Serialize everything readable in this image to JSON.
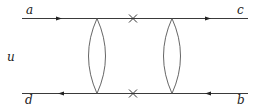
{
  "diagram": {
    "type": "feynman-diagram",
    "labels": {
      "top_left": "a",
      "top_right": "c",
      "bottom_left": "d",
      "bottom_right": "b",
      "left_middle": "u"
    },
    "lines": [
      {
        "name": "top-line",
        "from": "a",
        "to": "c",
        "direction": "right",
        "arrows": 2,
        "crosses": 1
      },
      {
        "name": "bottom-line",
        "from": "b",
        "to": "d",
        "direction": "left",
        "arrows": 2,
        "crosses": 1
      }
    ],
    "loops": [
      {
        "name": "left-lens",
        "shape": "lens"
      },
      {
        "name": "right-lens",
        "shape": "lens"
      }
    ],
    "colors": {
      "line": "#3a3a3a",
      "background": "#ffffff"
    }
  }
}
